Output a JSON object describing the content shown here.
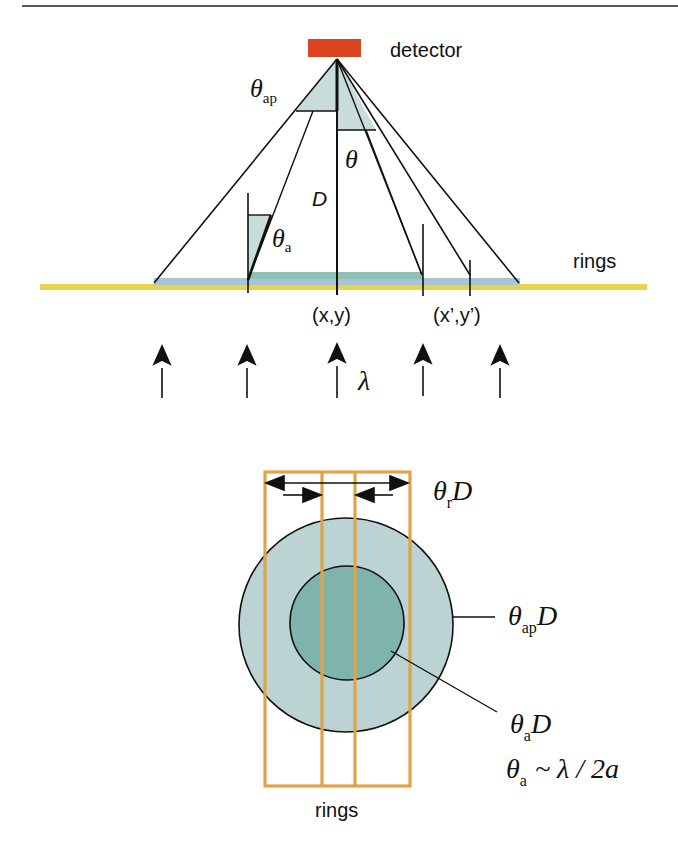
{
  "top_diagram": {
    "detector_label": "detector",
    "rings_label": "rings",
    "theta_ap_symbol": "θ",
    "theta_ap_subscript": "ap",
    "theta_symbol": "θ",
    "D_label": "D",
    "theta_a_symbol": "θ",
    "theta_a_subscript": "a",
    "point_label": "(x,y)",
    "point_prime_label": "(x’,y’)",
    "lambda_label": "λ"
  },
  "bottom_diagram": {
    "theta_r_symbol": "θ",
    "theta_r_subscript": "r",
    "theta_r_D": "D",
    "theta_ap_symbol": "θ",
    "theta_ap_subscript": "ap",
    "theta_ap_D": "D",
    "theta_a_symbol": "θ",
    "theta_a_subscript": "a",
    "theta_a_D": "D",
    "formula_symbol": "θ",
    "formula_subscript": "a",
    "formula_rhs": "~ λ / 2a",
    "rings_label": "rings"
  },
  "colors": {
    "detector": "#d9441e",
    "rings_bar": "#e8d34a",
    "footprint": "#a9c4d4",
    "aperture_band": "#8ec0b4",
    "cone_fill": "#c9dcdc",
    "outer_circle": "#bcd3d3",
    "inner_circle": "#7fb4ae",
    "ring_box": "#e0a447",
    "line": "#111111"
  }
}
